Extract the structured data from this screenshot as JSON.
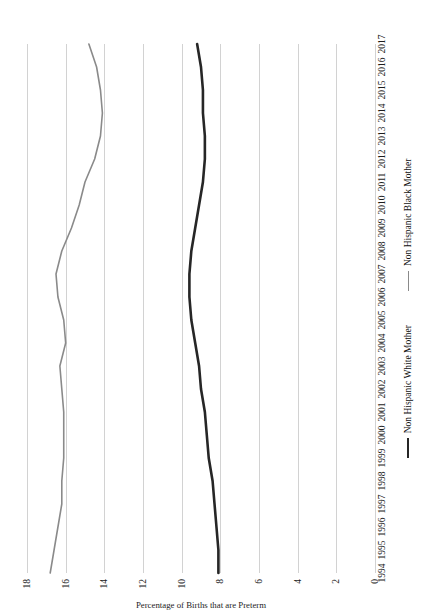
{
  "chart_data": {
    "type": "line",
    "title": "",
    "xlabel": "",
    "ylabel": "Percentage of Births that are Preterm",
    "x": [
      1994,
      1995,
      1996,
      1997,
      1998,
      1999,
      2000,
      2001,
      2002,
      2003,
      2004,
      2005,
      2006,
      2007,
      2008,
      2009,
      2010,
      2011,
      2012,
      2013,
      2014,
      2015,
      2016,
      2017
    ],
    "xtick_labels": [
      "1994",
      "1995",
      "1996",
      "1997",
      "1998",
      "1999",
      "2000",
      "2001",
      "2002",
      "2003",
      "2004",
      "2005",
      "2006",
      "2007",
      "2008",
      "2009",
      "2010",
      "2011",
      "2012",
      "2013",
      "2014",
      "2015",
      "2016",
      "2017"
    ],
    "ytick_labels": [
      "0",
      "2",
      "4",
      "6",
      "8",
      "10",
      "12",
      "14",
      "16",
      "18"
    ],
    "ytick_values": [
      0,
      2,
      4,
      6,
      8,
      10,
      12,
      14,
      16,
      18
    ],
    "ylim": [
      0,
      18
    ],
    "grid": true,
    "legend_position": "bottom",
    "series": [
      {
        "name": "Non Hispanic White Mother",
        "color": "#262626",
        "width": 2.6,
        "values": [
          8.1,
          8.1,
          8.2,
          8.3,
          8.4,
          8.6,
          8.7,
          8.8,
          9.0,
          9.1,
          9.3,
          9.5,
          9.6,
          9.6,
          9.5,
          9.3,
          9.1,
          8.9,
          8.8,
          8.8,
          8.9,
          8.9,
          9.0,
          9.2
        ]
      },
      {
        "name": "Non Hispanic Black Mother",
        "color": "#8a8a8a",
        "width": 1.6,
        "values": [
          16.8,
          16.6,
          16.4,
          16.2,
          16.2,
          16.1,
          16.1,
          16.1,
          16.2,
          16.3,
          16.0,
          16.1,
          16.4,
          16.5,
          16.2,
          15.7,
          15.3,
          15.0,
          14.5,
          14.2,
          14.1,
          14.2,
          14.4,
          14.8
        ]
      }
    ]
  },
  "axis": {
    "y_title": "Percentage of Births that are Preterm"
  },
  "legend": {
    "items": [
      {
        "label": "Non Hispanic White Mother",
        "swatch": "line-dark-swatch"
      },
      {
        "label": "Non Hispanic Black Mother",
        "swatch": "line-gray-swatch"
      }
    ]
  }
}
